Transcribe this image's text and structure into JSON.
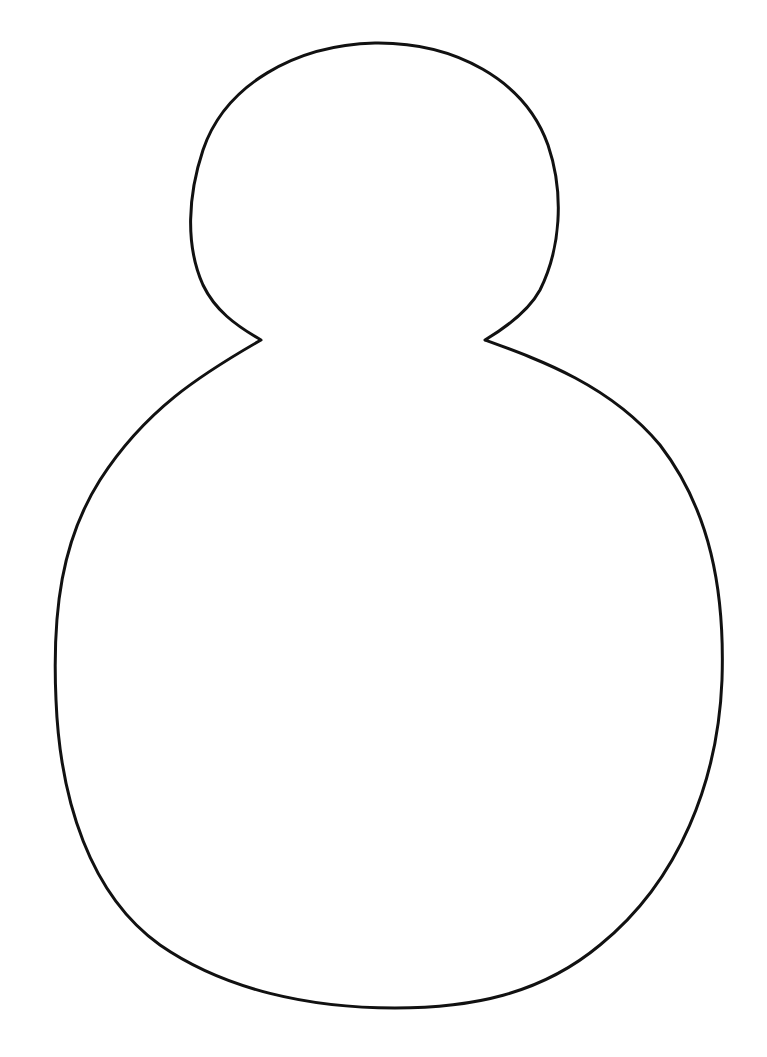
{
  "figure": {
    "stroke_color": "#111111",
    "background_color": "#ffffff",
    "stroke_width": 3
  }
}
